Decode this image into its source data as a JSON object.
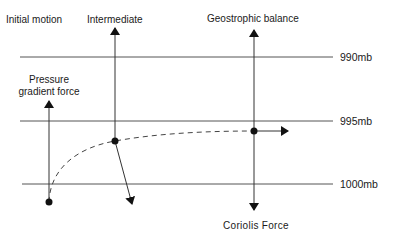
{
  "diagram": {
    "stages": {
      "initial": "Initial motion",
      "intermediate": "Intermediate",
      "geostrophic": "Geostrophic balance"
    },
    "forces": {
      "pressure_gradient_line1": "Pressure",
      "pressure_gradient_line2": "gradient force",
      "coriolis": "Coriolis Force"
    },
    "isobars": [
      {
        "label": "990mb",
        "y": 57
      },
      {
        "label": "995mb",
        "y": 121
      },
      {
        "label": "1000mb",
        "y": 184
      }
    ],
    "colors": {
      "line": "#555555",
      "ink": "#111111"
    }
  }
}
